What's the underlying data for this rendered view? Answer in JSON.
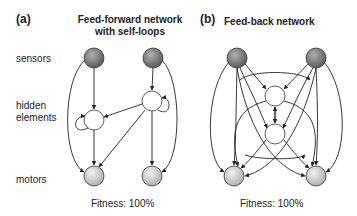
{
  "panel_a": {
    "letter": "(a)",
    "title_line1": "Feed-forward network",
    "title_line2": "with self-loops",
    "fitness": "Fitness: 100%"
  },
  "panel_b": {
    "letter": "(b)",
    "title": "Feed-back network",
    "fitness": "Fitness: 100%"
  },
  "row_labels": {
    "sensors": "sensors",
    "hidden_line1": "hidden",
    "hidden_line2": "elements",
    "motors": "motors"
  },
  "colors": {
    "sensor_fill": "#7a7a7a",
    "hidden_fill": "#ffffff",
    "motor_fill": "#cfcfcf",
    "edge": "#222222"
  }
}
